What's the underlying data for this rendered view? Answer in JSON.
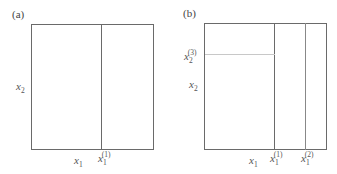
{
  "panels": [
    {
      "label": "(a)",
      "y_axis": {
        "var": "x",
        "sub": "2"
      },
      "x_labels": [
        {
          "var": "x",
          "sub": "1",
          "sup": ""
        },
        {
          "var": "x",
          "sub": "1",
          "sup": "(1)"
        }
      ]
    },
    {
      "label": "(b)",
      "y_axis": {
        "var": "x",
        "sub": "2"
      },
      "y_split": {
        "var": "x",
        "sub": "2",
        "sup": "(3)"
      },
      "x_labels": [
        {
          "var": "x",
          "sub": "1",
          "sup": ""
        },
        {
          "var": "x",
          "sub": "1",
          "sup": "(1)"
        },
        {
          "var": "x",
          "sub": "1",
          "sup": "(2)"
        }
      ]
    }
  ]
}
